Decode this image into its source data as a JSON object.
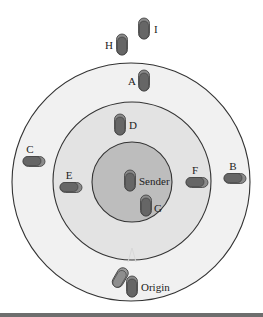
{
  "diagram": {
    "type": "concentric-zones-vehicle-positions",
    "colors": {
      "background": "#ffffff",
      "outer_zone": "#f1f1f1",
      "middle_zone": "#e3e3e3",
      "inner_zone": "#bdbdbd",
      "zone_stroke": "#333333",
      "vehicle_shadow": "#8a8a8a",
      "vehicle_body": "#666666",
      "vehicle_stroke": "#3a3a3a",
      "bottom_rule": "#6e6e6e"
    },
    "zones": [
      {
        "name": "outer",
        "cx": 131,
        "cy": 182,
        "r": 119
      },
      {
        "name": "middle",
        "cx": 132,
        "cy": 181,
        "r": 79
      },
      {
        "name": "inner",
        "cx": 132,
        "cy": 182,
        "r": 40
      }
    ],
    "vehicles": [
      {
        "id": "I",
        "label": "I",
        "x": 144,
        "y": 29,
        "orientation": "vertical",
        "label_dx": 10,
        "label_dy": 4
      },
      {
        "id": "H",
        "label": "H",
        "x": 122,
        "y": 45,
        "orientation": "vertical",
        "label_dx": -17,
        "label_dy": 4
      },
      {
        "id": "A",
        "label": "A",
        "x": 144,
        "y": 81,
        "orientation": "vertical",
        "label_dx": -16,
        "label_dy": 4
      },
      {
        "id": "D",
        "label": "D",
        "x": 120,
        "y": 125,
        "orientation": "vertical",
        "label_dx": 9,
        "label_dy": 4
      },
      {
        "id": "C",
        "label": "C",
        "x": 32,
        "y": 161,
        "orientation": "horizontal",
        "label_dx": -2,
        "label_dy": -8
      },
      {
        "id": "E",
        "label": "E",
        "x": 69,
        "y": 187,
        "orientation": "horizontal",
        "label_dx": 0,
        "label_dy": -8
      },
      {
        "id": "Sender",
        "label": "Sender",
        "x": 130,
        "y": 181,
        "orientation": "vertical",
        "label_dx": 9,
        "label_dy": 4
      },
      {
        "id": "F",
        "label": "F",
        "x": 195,
        "y": 182,
        "orientation": "horizontal",
        "label_dx": 0,
        "label_dy": -8
      },
      {
        "id": "B",
        "label": "B",
        "x": 233,
        "y": 178,
        "orientation": "horizontal",
        "label_dx": 0,
        "label_dy": -8
      },
      {
        "id": "G",
        "label": "G",
        "x": 146,
        "y": 206,
        "orientation": "vertical",
        "label_dx": 8,
        "label_dy": 6
      },
      {
        "id": "Origin-ghost",
        "label": "",
        "x": 120,
        "y": 278,
        "orientation": "tilted",
        "label_dx": 0,
        "label_dy": 0
      },
      {
        "id": "Origin",
        "label": "Origin",
        "x": 132,
        "y": 287,
        "orientation": "vertical",
        "label_dx": 9,
        "label_dy": 4
      }
    ]
  }
}
